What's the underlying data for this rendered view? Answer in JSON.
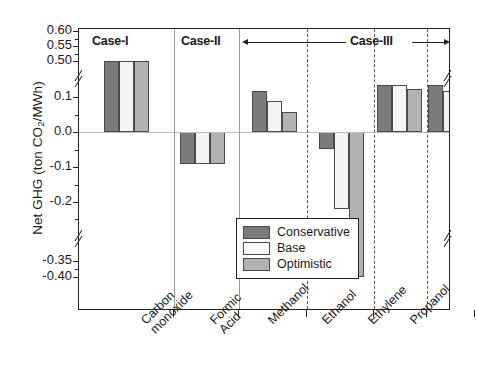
{
  "chart_data": {
    "type": "bar",
    "title": "",
    "xlabel": "",
    "ylabel": "Net GHG (ton CO2/MWh)",
    "ylabel_parts": {
      "pre": "Net GHG (ton CO",
      "sub": "2",
      "post": "/MWh)"
    },
    "grid": false,
    "legend_position": "inside-lower-right",
    "ylim": [
      -0.4,
      0.6
    ],
    "y_axis_breaks": [
      {
        "low": 0.135,
        "high": 0.455,
        "label": "upper-break-between-0.1-region-and-0.50"
      },
      {
        "low": -0.255,
        "high": -0.345,
        "label": "lower-break-between--0.2-and--0.35"
      }
    ],
    "ytick_labels": [
      "0.60",
      "0.55",
      "0.50",
      "0.1",
      "0.0",
      "-0.1",
      "-0.2",
      "-0.35",
      "-0.40"
    ],
    "ytick_values": [
      0.6,
      0.55,
      0.5,
      0.1,
      0.0,
      -0.1,
      -0.2,
      -0.35,
      -0.4
    ],
    "categories": [
      "Case-I",
      "Case-II",
      "Carbon monoxide",
      "Formic Acid",
      "Methanol",
      "Ethanol",
      "Ethylene",
      "Propanol"
    ],
    "category_axis_labels": [
      "",
      "",
      "Carbon\nmonoxide",
      "Formic\nAcid",
      "Methanol",
      "Ethanol",
      "Ethylene",
      "Propanol"
    ],
    "series": [
      {
        "name": "Conservative",
        "color": "#7b7b7b",
        "values": [
          0.5,
          -0.09,
          0.118,
          -0.048,
          0.148,
          0.14,
          0.146,
          0.078
        ]
      },
      {
        "name": "Base",
        "color": "#f4f4f2",
        "values": [
          0.5,
          -0.09,
          0.088,
          -0.22,
          0.14,
          0.118,
          0.138,
          0.01
        ]
      },
      {
        "name": "Optimistic",
        "color": "#b2b2b2",
        "values": [
          0.5,
          -0.09,
          0.058,
          -0.4,
          0.124,
          0.1,
          0.118,
          -0.048
        ]
      }
    ],
    "annotations": [
      {
        "text": "Case-I",
        "type": "group-label"
      },
      {
        "text": "Case-II",
        "type": "group-label"
      },
      {
        "text": "Case-III",
        "type": "group-label-with-double-arrow",
        "arrow": "double-headed",
        "spans": [
          "Carbon monoxide",
          "Propanol"
        ]
      }
    ]
  },
  "legend": {
    "items": [
      {
        "label": "Conservative",
        "swatch": "conservative"
      },
      {
        "label": "Base",
        "swatch": "base"
      },
      {
        "label": "Optimistic",
        "swatch": "optimistic"
      }
    ]
  },
  "axis": {
    "y_title_pre": "Net GHG (ton CO",
    "y_title_sub": "2",
    "y_title_post": "/MWh)"
  },
  "colors": {
    "conservative": "#7b7b7b",
    "base": "#f4f4f2",
    "optimistic": "#b2b2b2",
    "axis": "#222222",
    "separator_dashed": "#555555",
    "separator_solid": "#9a9a9a"
  }
}
